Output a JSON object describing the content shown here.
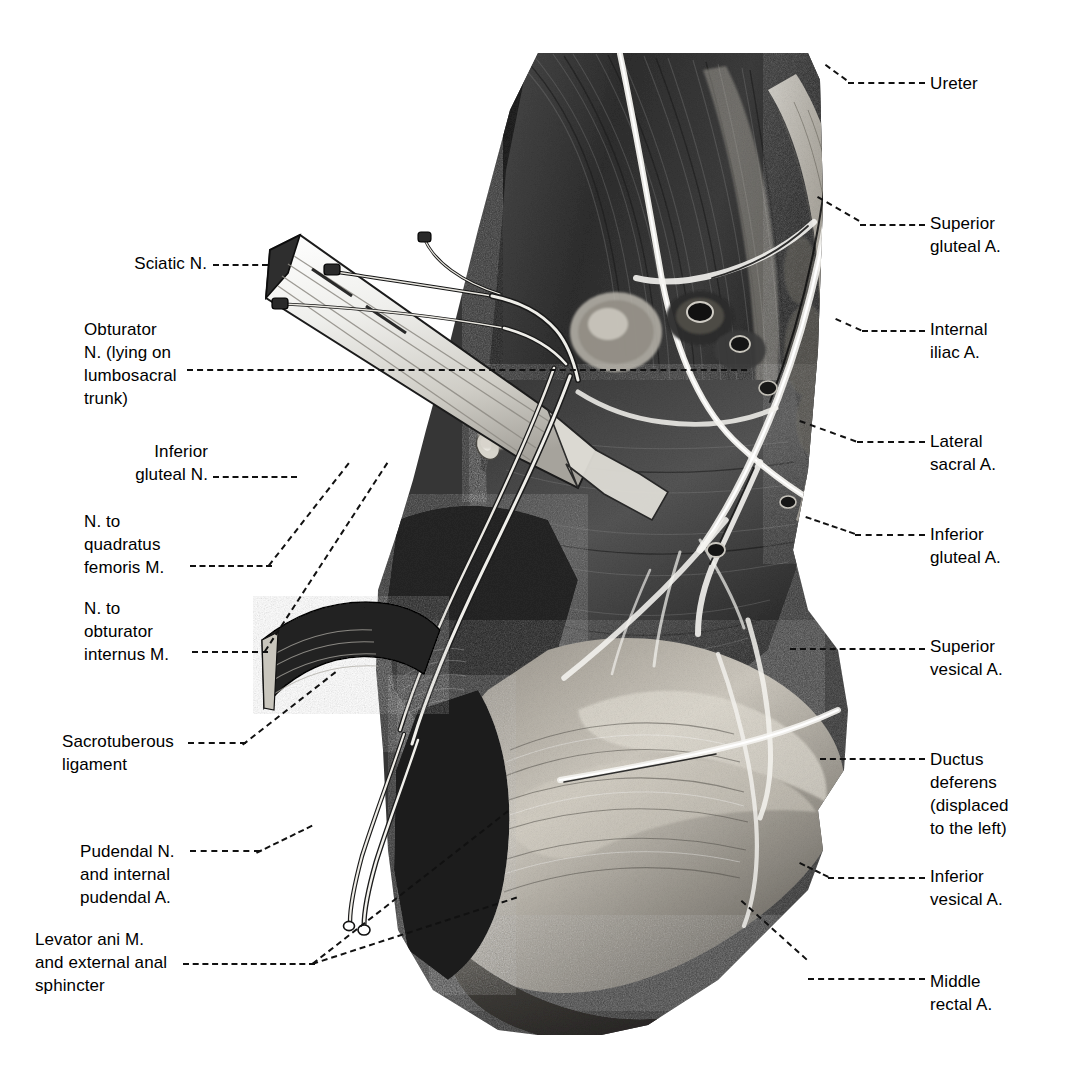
{
  "figure": {
    "type": "anatomical-dissection-photograph",
    "background_color": "#ffffff",
    "ink_color": "#000000",
    "photo_tone": "grayscale"
  },
  "labels_left": [
    {
      "id": "sciatic-nerve",
      "text": "Sciatic N.",
      "align": "right",
      "x": 95,
      "y": 252,
      "width": 112,
      "leader": {
        "x1": 213,
        "y1": 264,
        "x2": 268,
        "y2": 264
      }
    },
    {
      "id": "obturator-nerve",
      "text": "Obturator\nN. (lying on\nlumbosacral\ntrunk)",
      "align": "left",
      "x": 84,
      "y": 318,
      "width": 125,
      "leader": {
        "x1": 187,
        "y1": 369,
        "x2": 540,
        "y2": 369
      }
    },
    {
      "id": "inferior-gluteal-nerve",
      "text": "Inferior\ngluteal N.",
      "align": "right",
      "x": 90,
      "y": 440,
      "width": 118,
      "leader": {
        "x1": 213,
        "y1": 476,
        "x2": 283,
        "y2": 476
      }
    },
    {
      "id": "nerve-to-quadratus-femoris",
      "text": "N. to\nquadratus\nfemoris M.",
      "align": "left",
      "x": 84,
      "y": 510,
      "width": 120,
      "leader": {
        "x1": 190,
        "y1": 565,
        "x2": 272,
        "y2": 565
      }
    },
    {
      "id": "nerve-to-obturator-internus",
      "text": "N. to\nobturator\ninternus M.",
      "align": "left",
      "x": 84,
      "y": 597,
      "width": 127,
      "leader": {
        "x1": 192,
        "y1": 651,
        "x2": 268,
        "y2": 651
      }
    },
    {
      "id": "sacrotuberous-ligament",
      "text": "Sacrotuberous\nligament",
      "align": "left",
      "x": 62,
      "y": 730,
      "width": 145,
      "leader": {
        "x1": 188,
        "y1": 742,
        "x2": 245,
        "y2": 742
      }
    },
    {
      "id": "pudendal-nerve",
      "text": "Pudendal N.\nand internal\npudendal A.",
      "align": "left",
      "x": 80,
      "y": 840,
      "width": 128,
      "leader": {
        "x1": 190,
        "y1": 850,
        "x2": 258,
        "y2": 850
      }
    },
    {
      "id": "levator-ani",
      "text": "Levator ani M.\nand external anal\nsphincter",
      "align": "left",
      "x": 35,
      "y": 928,
      "width": 180,
      "leader": {
        "x1": 183,
        "y1": 963,
        "x2": 313,
        "y2": 963
      }
    }
  ],
  "labels_right": [
    {
      "id": "ureter",
      "text": "Ureter",
      "x": 930,
      "y": 72,
      "leader": {
        "x1": 848,
        "y1": 82,
        "x2": 925,
        "y2": 82
      }
    },
    {
      "id": "superior-gluteal-artery",
      "text": "Superior\ngluteal A.",
      "x": 930,
      "y": 212,
      "leader": {
        "x1": 860,
        "y1": 224,
        "x2": 925,
        "y2": 224
      }
    },
    {
      "id": "internal-iliac-artery",
      "text": "Internal\niliac A.",
      "x": 930,
      "y": 318,
      "leader": {
        "x1": 862,
        "y1": 330,
        "x2": 925,
        "y2": 330
      }
    },
    {
      "id": "lateral-sacral-artery",
      "text": "Lateral\nsacral A.",
      "x": 930,
      "y": 430,
      "leader": {
        "x1": 857,
        "y1": 441,
        "x2": 925,
        "y2": 441
      }
    },
    {
      "id": "inferior-gluteal-artery",
      "text": "Inferior\ngluteal A.",
      "x": 930,
      "y": 523,
      "leader": {
        "x1": 855,
        "y1": 534,
        "x2": 925,
        "y2": 534
      }
    },
    {
      "id": "superior-vesical-artery",
      "text": "Superior\nvesical A.",
      "x": 930,
      "y": 635,
      "leader": {
        "x1": 790,
        "y1": 648,
        "x2": 925,
        "y2": 648
      }
    },
    {
      "id": "ductus-deferens",
      "text": "Ductus\ndeferens\n(displaced\nto the left)",
      "x": 930,
      "y": 748,
      "leader": {
        "x1": 820,
        "y1": 758,
        "x2": 925,
        "y2": 758
      }
    },
    {
      "id": "inferior-vesical-artery",
      "text": "Inferior\nvesical A.",
      "x": 930,
      "y": 865,
      "leader": {
        "x1": 828,
        "y1": 877,
        "x2": 925,
        "y2": 877
      }
    },
    {
      "id": "middle-rectal-artery",
      "text": "Middle\nrectal A.",
      "x": 930,
      "y": 970,
      "leader": {
        "x1": 808,
        "y1": 978,
        "x2": 925,
        "y2": 978
      }
    }
  ]
}
